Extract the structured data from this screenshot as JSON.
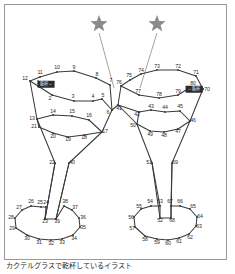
{
  "figure": {
    "title_caption": "カクテルグラスで乾杯しているイラスト",
    "frame_border_color": "#9a9a9a",
    "background_color": "#ffffff",
    "line_color": "#3a3a3a",
    "star_color": "#8a8a8a",
    "label_color": "#2a2a2a",
    "badge_background": "#2b2b2b",
    "badge_text_color": "#f2f2f2"
  },
  "badges": [
    {
      "id": "left-glass-badge",
      "text": "乾杯→",
      "x": 46,
      "y": 84
    },
    {
      "id": "right-glass-badge",
      "text": "←乾杯",
      "x": 194,
      "y": 89
    }
  ],
  "stars": [
    {
      "id": "star-left",
      "cx": 99,
      "cy": 24,
      "r": 9,
      "leader_to_x": 114,
      "leader_to_y": 88
    },
    {
      "id": "star-right",
      "cx": 157,
      "cy": 24,
      "r": 9,
      "leader_to_x": 140,
      "leader_to_y": 88
    }
  ],
  "dots": [
    {
      "n": 1,
      "x": 38,
      "y": 86,
      "lx": 38,
      "ly": 83
    },
    {
      "n": 2,
      "x": 52,
      "y": 95,
      "lx": 50,
      "ly": 99
    },
    {
      "n": 3,
      "x": 74,
      "y": 101,
      "lx": 73,
      "ly": 97
    },
    {
      "n": 4,
      "x": 93,
      "y": 101,
      "lx": 93,
      "ly": 97
    },
    {
      "n": 5,
      "x": 102,
      "y": 99,
      "lx": 103,
      "ly": 96
    },
    {
      "n": 6,
      "x": 112,
      "y": 110,
      "lx": 108,
      "ly": 113
    },
    {
      "n": 7,
      "x": 110,
      "y": 85,
      "lx": 111,
      "ly": 81
    },
    {
      "n": 8,
      "x": 96,
      "y": 78,
      "lx": 97,
      "ly": 75
    },
    {
      "n": 9,
      "x": 74,
      "y": 71,
      "lx": 74,
      "ly": 68
    },
    {
      "n": 10,
      "x": 57,
      "y": 72,
      "lx": 57,
      "ly": 68
    },
    {
      "n": 11,
      "x": 40,
      "y": 77,
      "lx": 40,
      "ly": 73
    },
    {
      "n": 12,
      "x": 30,
      "y": 81,
      "lx": 25,
      "ly": 79
    },
    {
      "n": 13,
      "x": 37,
      "y": 119,
      "lx": 32,
      "ly": 119
    },
    {
      "n": 14,
      "x": 53,
      "y": 115,
      "lx": 53,
      "ly": 112
    },
    {
      "n": 15,
      "x": 72,
      "y": 116,
      "lx": 72,
      "ly": 112
    },
    {
      "n": 16,
      "x": 89,
      "y": 120,
      "lx": 89,
      "ly": 116
    },
    {
      "n": 17,
      "x": 102,
      "y": 132,
      "lx": 105,
      "ly": 132
    },
    {
      "n": 18,
      "x": 84,
      "y": 135,
      "lx": 84,
      "ly": 138
    },
    {
      "n": 19,
      "x": 68,
      "y": 137,
      "lx": 68,
      "ly": 140
    },
    {
      "n": 20,
      "x": 53,
      "y": 133,
      "lx": 53,
      "ly": 137
    },
    {
      "n": 21,
      "x": 39,
      "y": 127,
      "lx": 34,
      "ly": 127
    },
    {
      "n": 22,
      "x": 55,
      "y": 163,
      "lx": 52,
      "ly": 163
    },
    {
      "n": 23,
      "x": 45,
      "y": 219,
      "lx": 45,
      "ly": 222
    },
    {
      "n": 24,
      "x": 46,
      "y": 207,
      "lx": 46,
      "ly": 203
    },
    {
      "n": 25,
      "x": 41,
      "y": 207,
      "lx": 40,
      "ly": 203
    },
    {
      "n": 26,
      "x": 31,
      "y": 206,
      "lx": 31,
      "ly": 202
    },
    {
      "n": 27,
      "x": 22,
      "y": 210,
      "lx": 19,
      "ly": 208
    },
    {
      "n": 28,
      "x": 15,
      "y": 218,
      "lx": 11,
      "ly": 218
    },
    {
      "n": 29,
      "x": 16,
      "y": 228,
      "lx": 12,
      "ly": 229
    },
    {
      "n": 30,
      "x": 27,
      "y": 235,
      "lx": 27,
      "ly": 239
    },
    {
      "n": 31,
      "x": 39,
      "y": 239,
      "lx": 39,
      "ly": 243
    },
    {
      "n": 32,
      "x": 51,
      "y": 240,
      "lx": 51,
      "ly": 244
    },
    {
      "n": 33,
      "x": 62,
      "y": 239,
      "lx": 62,
      "ly": 243
    },
    {
      "n": 34,
      "x": 73,
      "y": 235,
      "lx": 74,
      "ly": 239
    },
    {
      "n": 35,
      "x": 80,
      "y": 227,
      "lx": 83,
      "ly": 228
    },
    {
      "n": 36,
      "x": 79,
      "y": 218,
      "lx": 83,
      "ly": 218
    },
    {
      "n": 37,
      "x": 72,
      "y": 210,
      "lx": 75,
      "ly": 208
    },
    {
      "n": 38,
      "x": 64,
      "y": 206,
      "lx": 65,
      "ly": 202
    },
    {
      "n": 39,
      "x": 56,
      "y": 219,
      "lx": 57,
      "ly": 222
    },
    {
      "n": 40,
      "x": 69,
      "y": 163,
      "lx": 72,
      "ly": 163
    },
    {
      "n": 41,
      "x": 118,
      "y": 105,
      "lx": 119,
      "ly": 109
    },
    {
      "n": 42,
      "x": 139,
      "y": 112,
      "lx": 137,
      "ly": 115
    },
    {
      "n": 43,
      "x": 151,
      "y": 110,
      "lx": 151,
      "ly": 107
    },
    {
      "n": 44,
      "x": 165,
      "y": 112,
      "lx": 165,
      "ly": 108
    },
    {
      "n": 45,
      "x": 180,
      "y": 111,
      "lx": 180,
      "ly": 107
    },
    {
      "n": 46,
      "x": 190,
      "y": 121,
      "lx": 193,
      "ly": 121
    },
    {
      "n": 47,
      "x": 178,
      "y": 129,
      "lx": 178,
      "ly": 132
    },
    {
      "n": 48,
      "x": 164,
      "y": 132,
      "lx": 164,
      "ly": 136
    },
    {
      "n": 49,
      "x": 150,
      "y": 131,
      "lx": 150,
      "ly": 135
    },
    {
      "n": 50,
      "x": 137,
      "y": 124,
      "lx": 133,
      "ly": 126
    },
    {
      "n": 51,
      "x": 152,
      "y": 163,
      "lx": 149,
      "ly": 163
    },
    {
      "n": 52,
      "x": 160,
      "y": 218,
      "lx": 160,
      "ly": 221
    },
    {
      "n": 53,
      "x": 160,
      "y": 206,
      "lx": 160,
      "ly": 202
    },
    {
      "n": 54,
      "x": 151,
      "y": 206,
      "lx": 150,
      "ly": 202
    },
    {
      "n": 55,
      "x": 141,
      "y": 209,
      "lx": 139,
      "ly": 207
    },
    {
      "n": 56,
      "x": 134,
      "y": 217,
      "lx": 131,
      "ly": 218
    },
    {
      "n": 57,
      "x": 135,
      "y": 227,
      "lx": 132,
      "ly": 229
    },
    {
      "n": 58,
      "x": 145,
      "y": 236,
      "lx": 145,
      "ly": 240
    },
    {
      "n": 59,
      "x": 157,
      "y": 239,
      "lx": 157,
      "ly": 243
    },
    {
      "n": 60,
      "x": 168,
      "y": 240,
      "lx": 168,
      "ly": 244
    },
    {
      "n": 61,
      "x": 179,
      "y": 238,
      "lx": 179,
      "ly": 242
    },
    {
      "n": 62,
      "x": 189,
      "y": 234,
      "lx": 190,
      "ly": 238
    },
    {
      "n": 63,
      "x": 196,
      "y": 226,
      "lx": 199,
      "ly": 227
    },
    {
      "n": 64,
      "x": 197,
      "y": 217,
      "lx": 200,
      "ly": 217
    },
    {
      "n": 65,
      "x": 190,
      "y": 209,
      "lx": 193,
      "ly": 207
    },
    {
      "n": 66,
      "x": 180,
      "y": 206,
      "lx": 180,
      "ly": 202
    },
    {
      "n": 67,
      "x": 171,
      "y": 206,
      "lx": 170,
      "ly": 202
    },
    {
      "n": 68,
      "x": 171,
      "y": 218,
      "lx": 172,
      "ly": 221
    },
    {
      "n": 69,
      "x": 172,
      "y": 163,
      "lx": 175,
      "ly": 163
    },
    {
      "n": 70,
      "x": 203,
      "y": 89,
      "lx": 207,
      "ly": 90
    },
    {
      "n": 71,
      "x": 196,
      "y": 76,
      "lx": 196,
      "ly": 73
    },
    {
      "n": 72,
      "x": 178,
      "y": 70,
      "lx": 178,
      "ly": 67
    },
    {
      "n": 73,
      "x": 157,
      "y": 70,
      "lx": 157,
      "ly": 67
    },
    {
      "n": 74,
      "x": 141,
      "y": 74,
      "lx": 141,
      "ly": 71
    },
    {
      "n": 75,
      "x": 130,
      "y": 80,
      "lx": 129,
      "ly": 76
    },
    {
      "n": 76,
      "x": 121,
      "y": 86,
      "lx": 119,
      "ly": 83
    },
    {
      "n": 77,
      "x": 139,
      "y": 95,
      "lx": 138,
      "ly": 92
    },
    {
      "n": 78,
      "x": 159,
      "y": 98,
      "lx": 159,
      "ly": 95
    },
    {
      "n": 79,
      "x": 178,
      "y": 95,
      "lx": 178,
      "ly": 92
    },
    {
      "n": 80,
      "x": 191,
      "y": 87,
      "lx": 193,
      "ly": 84
    }
  ]
}
